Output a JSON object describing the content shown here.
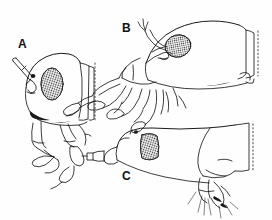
{
  "figure": {
    "kind": "scientific-line-drawing",
    "background_color": "#fefefe",
    "ink_color": "#1a1a1a",
    "panel_count": 3
  },
  "panels": [
    {
      "id": "A",
      "label": "A",
      "label_x": 18,
      "label_y": 38,
      "description": "head in lateral view, rounded capsule, antenna directed anteriorly, compound eye oval and stippled, segmented maxillary palps pendant below",
      "eye_shape": "oval",
      "eye_texture": "stipple",
      "posterior_margin": "dotted"
    },
    {
      "id": "B",
      "label": "B",
      "label_x": 122,
      "label_y": 22,
      "description": "elongate head declined anteroventrally, compound eye oval and stippled, short antenna, elongate segmented mouthparts projecting anteroventrally",
      "eye_shape": "oval",
      "eye_texture": "stipple",
      "posterior_margin": "dotted"
    },
    {
      "id": "C",
      "label": "C",
      "label_x": 122,
      "label_y": 170,
      "description": "head in lateral view with short tubular rostrum projecting anteriorly, large rounded-rectangular stippled compound eye, posterior coxal region with setae",
      "eye_shape": "rounded-rectangle",
      "eye_texture": "stipple",
      "posterior_margin": "dotted"
    }
  ]
}
